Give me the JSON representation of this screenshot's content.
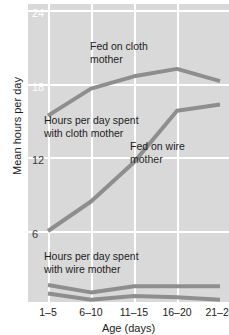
{
  "chart_data": {
    "type": "line",
    "title": "",
    "xlabel": "Age (days)",
    "ylabel": "Mean hours per day",
    "categories": [
      "1–5",
      "6–10",
      "11–15",
      "16–20",
      "21–25"
    ],
    "ylim": [
      0,
      24
    ],
    "yticks": [
      6,
      12,
      18,
      24
    ],
    "ytick_labels": [
      "6",
      "12",
      "18",
      "24"
    ],
    "grid": true,
    "legend": "none",
    "series": [
      {
        "name": "Fed on cloth mother",
        "values": [
          15.4,
          17.6,
          18.6,
          19.2,
          18.2
        ]
      },
      {
        "name": "Fed on wire mother",
        "values": [
          6.0,
          8.4,
          11.6,
          15.8,
          16.3
        ]
      },
      {
        "name": "Cloth-fed: with wire mother",
        "values": [
          1.6,
          1.0,
          1.5,
          1.5,
          1.5
        ]
      },
      {
        "name": "Wire-fed: with wire mother",
        "values": [
          0.9,
          0.4,
          0.7,
          0.6,
          0.4
        ]
      }
    ],
    "annotations": [
      {
        "id": "ann-fed-cloth",
        "text": "Fed on cloth\nmother"
      },
      {
        "id": "ann-cloth-hours",
        "text": "Hours per day spent\nwith cloth mother"
      },
      {
        "id": "ann-fed-wire",
        "text": "Fed on wire\nmother"
      },
      {
        "id": "ann-wire-hours",
        "text": "Hours per day spent\nwith wire mother"
      }
    ],
    "colors": {
      "panel_background": "#d9d9d9",
      "gridline": "#ffffff",
      "line": "#8e8e8e",
      "text": "#1c1c1c",
      "tick_on_panel": "#ffffff"
    }
  },
  "annotations": {
    "fed_cloth_l1": "Fed on cloth",
    "fed_cloth_l2": "mother",
    "cloth_hours_l1": "Hours per day spent",
    "cloth_hours_l2": "with cloth mother",
    "fed_wire_l1": "Fed on wire",
    "fed_wire_l2": "mother",
    "wire_hours_l1": "Hours per day spent",
    "wire_hours_l2": "with wire mother"
  },
  "axes": {
    "ylabel": "Mean hours per day",
    "xlabel": "Age (days)",
    "yticks": [
      "24",
      "18",
      "12",
      "6"
    ],
    "xticks": [
      "1–5",
      "6–10",
      "11–15",
      "16–20",
      "21–25"
    ]
  }
}
